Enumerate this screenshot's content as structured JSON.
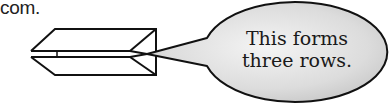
{
  "text_fragment": "com.",
  "callout": {
    "lines": [
      "This forms",
      "three rows."
    ],
    "fill_color": "#d9d9d9",
    "stroke_color": "#111111"
  },
  "figure": {
    "label": "folded-paper-three-rows",
    "stroke_color": "#111111"
  }
}
